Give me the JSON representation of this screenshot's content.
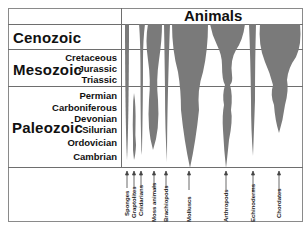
{
  "header": {
    "title": "Animals"
  },
  "eras": [
    {
      "name": "Cenozoic",
      "periods": []
    },
    {
      "name": "Mesozoic",
      "periods": [
        "Cretaceous",
        "Jurassic",
        "Triassic"
      ]
    },
    {
      "name": "Paleozoic",
      "periods": [
        "Permian",
        "Carboniferous",
        "Devonian",
        "Silurian",
        "Ordovician",
        "Cambrian"
      ]
    }
  ],
  "animals": [
    {
      "name": "Sponges"
    },
    {
      "name": "Graptolites"
    },
    {
      "name": "Cnidarians"
    },
    {
      "name": "Moss animals"
    },
    {
      "name": "Brachiopods"
    },
    {
      "name": "Molluscs"
    },
    {
      "name": "Arthropods"
    },
    {
      "name": "Echinoderms"
    },
    {
      "name": "Chordates"
    }
  ],
  "colors": {
    "spindle": "#7a7a7a",
    "line": "#6e6e6e",
    "text": "#111111"
  }
}
